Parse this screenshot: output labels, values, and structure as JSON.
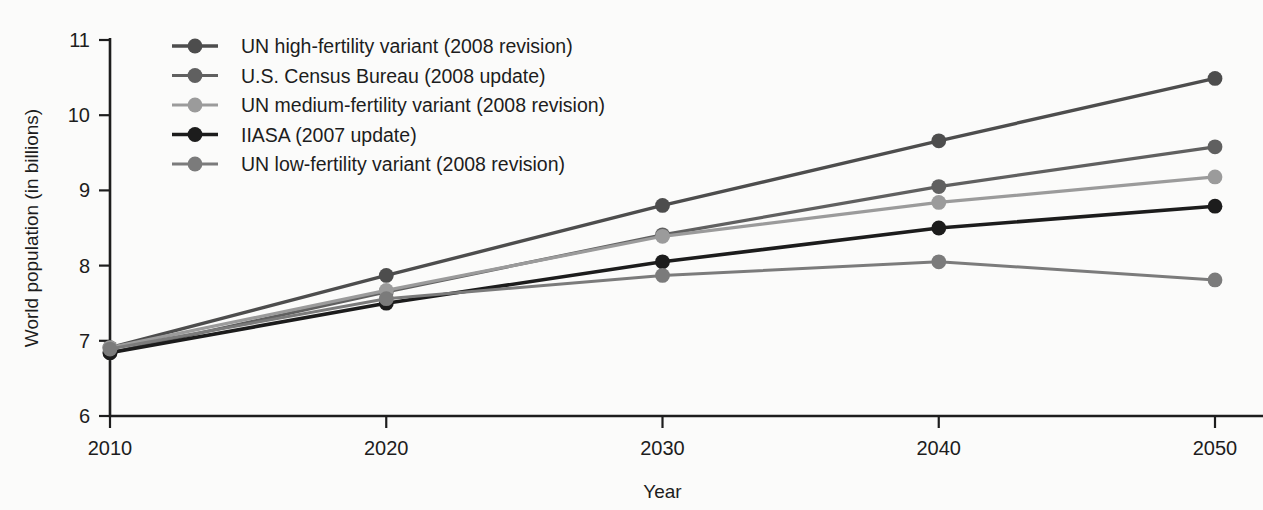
{
  "chart_data": {
    "type": "line",
    "title": "",
    "xlabel": "Year",
    "ylabel": "World population (in billions)",
    "x": [
      2010,
      2020,
      2030,
      2040,
      2050
    ],
    "xtick_labels": [
      "2010",
      "2020",
      "2030",
      "2040",
      "2050"
    ],
    "ytick_labels": [
      "6",
      "7",
      "8",
      "9",
      "10",
      "11"
    ],
    "yticks": [
      6,
      7,
      8,
      9,
      10,
      11
    ],
    "ylim": [
      6,
      11
    ],
    "xlim": [
      2010,
      2050
    ],
    "grid": false,
    "legend_position": "upper-left-inside",
    "series": [
      {
        "name": "UN high-fertility variant (2008 revision)",
        "color": "#4d4d4d",
        "width": 3.4,
        "marker": "circle",
        "values": [
          6.91,
          7.87,
          8.8,
          9.66,
          10.49
        ]
      },
      {
        "name": "U.S. Census Bureau (2008 update)",
        "color": "#606060",
        "width": 3.2,
        "marker": "circle",
        "values": [
          6.84,
          7.65,
          8.41,
          9.05,
          9.58
        ]
      },
      {
        "name": "UN medium-fertility variant (2008 revision)",
        "color": "#9b9b9b",
        "width": 3.2,
        "marker": "circle",
        "values": [
          6.91,
          7.67,
          8.39,
          8.84,
          9.18
        ]
      },
      {
        "name": "IIASA (2007 update)",
        "color": "#1c1c1c",
        "width": 3.6,
        "marker": "circle",
        "values": [
          6.84,
          7.5,
          8.05,
          8.5,
          8.79
        ]
      },
      {
        "name": "UN low-fertility variant (2008 revision)",
        "color": "#7b7b7b",
        "width": 3.0,
        "marker": "circle",
        "values": [
          6.89,
          7.56,
          7.87,
          8.05,
          7.81
        ]
      }
    ]
  }
}
